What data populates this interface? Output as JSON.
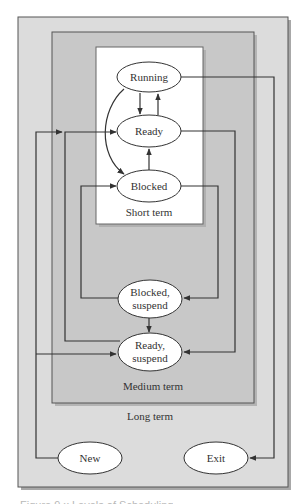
{
  "diagram": {
    "title": "Levels of Scheduling",
    "colors": {
      "page_bg": "#ffffff",
      "long_term_fill": "#dcdcdc",
      "medium_term_fill": "#c8c8c8",
      "short_term_fill": "#ffffff",
      "border": "#555555",
      "line": "#333333",
      "ellipse_fill": "#ffffff",
      "shadow": "#a8a8a8"
    },
    "regions": {
      "long_term": {
        "label": "Long term"
      },
      "medium_term": {
        "label": "Medium term"
      },
      "short_term": {
        "label": "Short term"
      }
    },
    "states": {
      "running": {
        "label": "Running"
      },
      "ready": {
        "label": "Ready"
      },
      "blocked": {
        "label": "Blocked"
      },
      "blocked_suspend": {
        "line1": "Blocked,",
        "line2": "suspend"
      },
      "ready_suspend": {
        "line1": "Ready,",
        "line2": "suspend"
      },
      "new": {
        "label": "New"
      },
      "exit": {
        "label": "Exit"
      }
    },
    "transitions": [
      {
        "from": "Running",
        "to": "Ready"
      },
      {
        "from": "Ready",
        "to": "Running"
      },
      {
        "from": "Running",
        "to": "Blocked"
      },
      {
        "from": "Blocked",
        "to": "Ready"
      },
      {
        "from": "Running",
        "to": "Exit"
      },
      {
        "from": "Ready",
        "to": "Ready, suspend"
      },
      {
        "from": "Blocked",
        "to": "Blocked, suspend"
      },
      {
        "from": "Blocked, suspend",
        "to": "Blocked"
      },
      {
        "from": "Blocked, suspend",
        "to": "Ready, suspend"
      },
      {
        "from": "Ready, suspend",
        "to": "Ready"
      },
      {
        "from": "New",
        "to": "Ready"
      },
      {
        "from": "New",
        "to": "Ready, suspend"
      }
    ],
    "caption": "Figure 9.x  Levels of Scheduling"
  }
}
